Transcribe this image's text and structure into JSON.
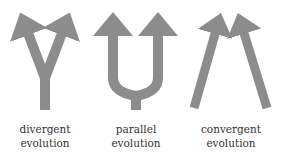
{
  "colors": {
    "arrow": "#8c8c8c",
    "text": "#333333",
    "background": "#ffffff"
  },
  "diagrams": [
    {
      "id": "divergent",
      "line1": "divergent",
      "line2": "evolution"
    },
    {
      "id": "parallel",
      "line1": "parallel",
      "line2": "evolution"
    },
    {
      "id": "convergent",
      "line1": "convergent",
      "line2": "evolution"
    }
  ]
}
